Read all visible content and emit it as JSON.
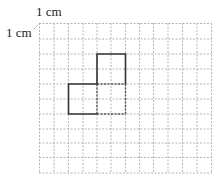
{
  "labels": {
    "top_unit": "1 cm",
    "left_unit": "1 cm"
  },
  "grid": {
    "columns": 12,
    "rows": 10,
    "cell_unit": "1 cm",
    "line_style": "dashed",
    "line_color": "#b0b0b0"
  },
  "shape": {
    "description": "L-shaped figure made of 2x2 cm squares",
    "outline_color": "#333333",
    "solid_squares": [
      "lower-left 2x2",
      "upper-right 2x2"
    ],
    "dashed_square": "lower-right 2x2"
  }
}
